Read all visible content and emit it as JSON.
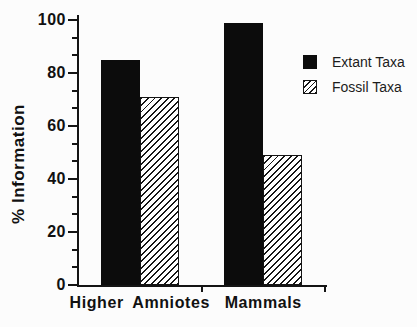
{
  "chart_data": {
    "type": "bar",
    "title": "",
    "xlabel": "",
    "ylabel": "% Information",
    "categories": [
      "Higher Amniotes",
      "Mammals"
    ],
    "series": [
      {
        "name": "Extant Taxa",
        "style": "solid-black",
        "values": [
          85,
          99
        ]
      },
      {
        "name": "Fossil Taxa",
        "style": "diagonal-hatch",
        "values": [
          71,
          49
        ]
      }
    ],
    "ylim": [
      0,
      100
    ],
    "yticks": [
      0,
      20,
      40,
      60,
      80,
      100
    ],
    "minor_ticks_per_major_interval": 2,
    "grid": false,
    "legend_position": "upper-right"
  },
  "legend": {
    "items": [
      {
        "label": "Extant Taxa",
        "swatch": "solid-black"
      },
      {
        "label": "Fossil Taxa",
        "swatch": "diagonal-hatch"
      }
    ]
  },
  "colors": {
    "background": "#fcfcfc",
    "bar_fill": "#0c0c0c",
    "hatch_line": "#161616",
    "axis": "#141414"
  }
}
